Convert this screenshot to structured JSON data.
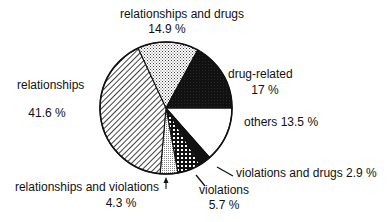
{
  "chart_data": {
    "type": "pie",
    "title": "",
    "start_angle_deg": 0,
    "direction": "clockwise",
    "slices": [
      {
        "label": "others",
        "value": 13.5,
        "value_label": "13.5 %",
        "pattern": "white"
      },
      {
        "label": "violations and drugs",
        "value": 2.9,
        "value_label": "2.9 %",
        "pattern": "black"
      },
      {
        "label": "violations",
        "value": 5.7,
        "value_label": "5.7 %",
        "pattern": "grid"
      },
      {
        "label": "relationships and violations",
        "value": 4.3,
        "value_label": "4.3 %",
        "pattern": "fine-dots"
      },
      {
        "label": "relationships",
        "value": 41.6,
        "value_label": "41.6 %",
        "pattern": "diagonal-hatch"
      },
      {
        "label": "relationships and drugs",
        "value": 14.9,
        "value_label": "14.9 %",
        "pattern": "stipple"
      },
      {
        "label": "drug-related",
        "value": 17,
        "value_label": "17 %",
        "pattern": "dense-black"
      }
    ],
    "labels": {
      "others": "others  13.5 %",
      "violations_and_drugs": "violations and drugs  2.9 %",
      "violations_name": "violations",
      "violations_value": "5.7 %",
      "rel_viol_name": "relationships and violations",
      "rel_viol_value": "4.3 %",
      "relationships_name": "relationships",
      "relationships_value": "41.6 %",
      "rel_drugs_name": "relationships and drugs",
      "rel_drugs_value": "14.9 %",
      "drug_related_name": "drug-related",
      "drug_related_value": "17 %"
    }
  }
}
